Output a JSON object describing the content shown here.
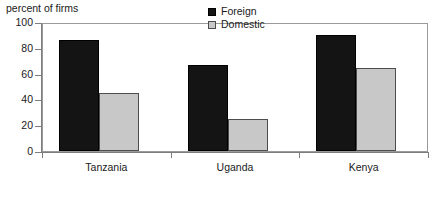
{
  "chart_data": {
    "type": "bar",
    "title": "percent of firms",
    "xlabel": "",
    "ylabel": "",
    "ylim": [
      0,
      100
    ],
    "yticks": [
      0,
      20,
      40,
      60,
      80,
      100
    ],
    "ytick_labels": [
      "0",
      "20",
      "40",
      "60",
      "80",
      "100"
    ],
    "categories": [
      "Tanzania",
      "Uganda",
      "Kenya"
    ],
    "series": [
      {
        "name": "Foreign",
        "color": "#141414",
        "values": [
          86,
          67,
          90
        ]
      },
      {
        "name": "Domestic",
        "color": "#c8c8c8",
        "values": [
          45,
          25,
          64
        ]
      }
    ],
    "legend_position": "upper-center-right",
    "grid": false,
    "frame": true
  },
  "legend": {
    "entries": [
      {
        "label": "Foreign",
        "swatch": "foreign-swatch"
      },
      {
        "label": "Domestic",
        "swatch": "domestic-swatch"
      }
    ]
  }
}
